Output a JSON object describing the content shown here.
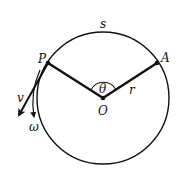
{
  "diagram": {
    "type": "circular-motion",
    "labels": {
      "arc": "s",
      "point_p": "P",
      "point_a": "A",
      "center": "O",
      "angle": "θ",
      "radius": "r",
      "velocity": "v",
      "angular_velocity": "ω"
    },
    "colors": {
      "stroke": "#111111",
      "background": "#ffffff"
    }
  }
}
